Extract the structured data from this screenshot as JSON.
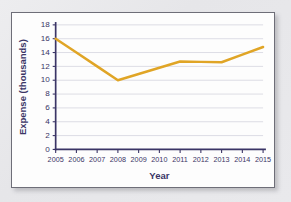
{
  "chart_data": {
    "type": "line",
    "title": "",
    "xlabel": "Year",
    "ylabel": "Expense (thousands)",
    "x": [
      2005,
      2006,
      2007,
      2008,
      2009,
      2010,
      2011,
      2012,
      2013,
      2014,
      2015
    ],
    "categories": [
      "2005",
      "2006",
      "2007",
      "2008",
      "2009",
      "2010",
      "2011",
      "2012",
      "2013",
      "2014",
      "2015"
    ],
    "values": [
      16,
      14,
      12,
      10,
      10.9,
      11.8,
      12.7,
      12.65,
      12.6,
      13.7,
      14.8
    ],
    "series": [
      {
        "name": "Expense",
        "values": [
          16,
          14,
          12,
          10,
          10.9,
          11.8,
          12.7,
          12.65,
          12.6,
          13.7,
          14.8
        ]
      }
    ],
    "xlim": [
      2005,
      2015
    ],
    "ylim": [
      0,
      18
    ],
    "ytick_labels": [
      "0",
      "2",
      "4",
      "6",
      "8",
      "10",
      "12",
      "14",
      "16",
      "18"
    ],
    "ytick_values": [
      0,
      2,
      4,
      6,
      8,
      10,
      12,
      14,
      16,
      18
    ],
    "xtick_labels": [
      "2005",
      "2006",
      "2007",
      "2008",
      "2009",
      "2010",
      "2011",
      "2012",
      "2013",
      "2014",
      "2015"
    ],
    "grid": "horizontal",
    "legend": "none",
    "annotations": [],
    "colors": {
      "line": "#e0a526",
      "axis": "#3b3566",
      "grid": "#d9d9e2",
      "plot_background": "#fdfdfd",
      "page_background": "#e8e8ea",
      "border": "#6e6e78"
    }
  }
}
